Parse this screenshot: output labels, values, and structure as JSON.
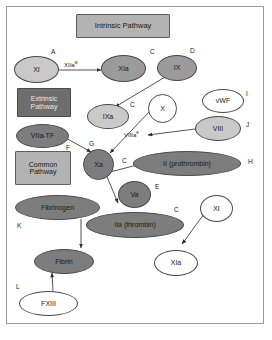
{
  "diagram": {
    "colors": {
      "header_box_fill": "#b3b3b3",
      "extrinsic_box_fill": "#6e6e6e",
      "light_gray_fill": "#c9c9c9",
      "mid_gray_fill": "#9b9b9b",
      "dark_gray_fill": "#7d7d7d",
      "white_fill": "#ffffff",
      "stroke": "#3a3a3a",
      "frame": "#9a9a9a",
      "text": "#1a1a1a"
    },
    "boxes": [
      {
        "id": "intrinsic",
        "label": "Intrinsic Pathway",
        "shape": "rect",
        "fill": "header"
      },
      {
        "id": "extrinsic",
        "label": "Extrinsic Pathway",
        "shape": "rect",
        "fill": "dark"
      },
      {
        "id": "common",
        "label": "Common Pathway",
        "shape": "rect",
        "fill": "header"
      }
    ],
    "nodes": [
      {
        "id": "xi",
        "label": "XI",
        "shape": "ellipse",
        "fill": "light"
      },
      {
        "id": "xia_top",
        "label": "XIa",
        "shape": "ellipse",
        "fill": "mid"
      },
      {
        "id": "ix",
        "label": "IX",
        "shape": "ellipse",
        "fill": "mid"
      },
      {
        "id": "ixa",
        "label": "IXa",
        "shape": "ellipse",
        "fill": "light"
      },
      {
        "id": "x",
        "label": "X",
        "shape": "ellipse",
        "fill": "white"
      },
      {
        "id": "vwf",
        "label": "vWF",
        "shape": "ellipse",
        "fill": "white"
      },
      {
        "id": "viii",
        "label": "VIII",
        "shape": "ellipse",
        "fill": "light"
      },
      {
        "id": "viia_tf",
        "label": "VIIa-TF",
        "shape": "ellipse",
        "fill": "dark"
      },
      {
        "id": "xa",
        "label": "Xa",
        "shape": "ellipse",
        "fill": "dark"
      },
      {
        "id": "prothrombin",
        "label": "II (prothrombin)",
        "shape": "ellipse",
        "fill": "dark"
      },
      {
        "id": "va",
        "label": "Va",
        "shape": "ellipse",
        "fill": "dark"
      },
      {
        "id": "fibrinogen",
        "label": "Fibrinogen",
        "shape": "ellipse",
        "fill": "dark"
      },
      {
        "id": "thrombin",
        "label": "IIa (thrombin)",
        "shape": "ellipse",
        "fill": "dark"
      },
      {
        "id": "xi_right",
        "label": "XI",
        "shape": "ellipse",
        "fill": "white"
      },
      {
        "id": "xia_bottom",
        "label": "XIa",
        "shape": "ellipse",
        "fill": "white"
      },
      {
        "id": "fibrin",
        "label": "Fibrin",
        "shape": "ellipse",
        "fill": "dark"
      },
      {
        "id": "fxiii",
        "label": "FXIII",
        "shape": "ellipse",
        "fill": "white"
      }
    ],
    "edge_labels": [
      {
        "id": "xiia",
        "text": "XIIa",
        "sup": "B"
      },
      {
        "id": "viiia",
        "text": "VIIIa",
        "sup": "E"
      }
    ],
    "annotations": [
      {
        "id": "a",
        "text": "A"
      },
      {
        "id": "c1",
        "text": "C"
      },
      {
        "id": "d",
        "text": "D"
      },
      {
        "id": "c2",
        "text": "C"
      },
      {
        "id": "i",
        "text": "I"
      },
      {
        "id": "j",
        "text": "J"
      },
      {
        "id": "f",
        "text": "F"
      },
      {
        "id": "g",
        "text": "G"
      },
      {
        "id": "c3",
        "text": "C"
      },
      {
        "id": "h",
        "text": "H"
      },
      {
        "id": "e",
        "text": "E"
      },
      {
        "id": "c4",
        "text": "C"
      },
      {
        "id": "k",
        "text": "K"
      },
      {
        "id": "l",
        "text": "L"
      }
    ]
  }
}
